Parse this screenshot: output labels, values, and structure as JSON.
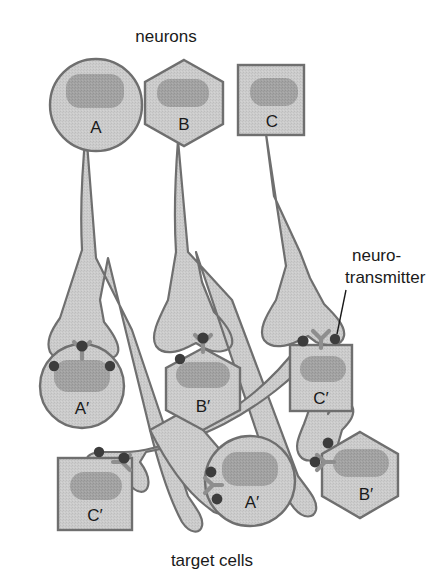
{
  "figure": {
    "title_top": "neurons",
    "caption_bottom": "target cells",
    "callout_line1": "neuro-",
    "callout_line2": "transmitter"
  },
  "colors": {
    "cytoplasm_fill": "#c9c9c9",
    "nucleus_fill": "#a0a0a0",
    "outline": "#6f6f6f",
    "neurite_fill": "#c4c4c4",
    "neurotransmitter_dot": "#3c3c3c",
    "receptor": "#9a9a9a",
    "text": "#1a1a1a",
    "background": "#ffffff"
  },
  "neurons": [
    {
      "id": "A",
      "label": "A",
      "shape": "circle",
      "cx": 96,
      "cy": 105
    },
    {
      "id": "B",
      "label": "B",
      "shape": "hexagon",
      "cx": 184,
      "cy": 102
    },
    {
      "id": "C",
      "label": "C",
      "shape": "square",
      "cx": 272,
      "cy": 100
    }
  ],
  "target_cells": [
    {
      "id": "A-prime-1",
      "label": "A′",
      "shape": "circle",
      "cx": 82,
      "cy": 386
    },
    {
      "id": "B-prime-1",
      "label": "B′",
      "shape": "hexagon",
      "cx": 203,
      "cy": 385
    },
    {
      "id": "C-prime-1",
      "label": "C′",
      "shape": "square",
      "cx": 320,
      "cy": 378
    },
    {
      "id": "C-prime-2",
      "label": "C′",
      "shape": "square",
      "cx": 97,
      "cy": 492
    },
    {
      "id": "A-prime-2",
      "label": "A′",
      "shape": "circle",
      "cx": 250,
      "cy": 481
    },
    {
      "id": "B-prime-2",
      "label": "B′",
      "shape": "hexagon",
      "cx": 360,
      "cy": 472
    }
  ],
  "synapses": [
    {
      "id": "synapse-A-to-Aprime1",
      "x": 82,
      "y": 352,
      "orientation": "down"
    },
    {
      "id": "synapse-B-to-Bprime1",
      "x": 203,
      "y": 345,
      "orientation": "down"
    },
    {
      "id": "synapse-C-to-Cprime1",
      "x": 320,
      "y": 339,
      "orientation": "down"
    },
    {
      "id": "synapse-to-Cprime2",
      "x": 122,
      "y": 461,
      "orientation": "down"
    },
    {
      "id": "synapse-to-Aprime2",
      "x": 213,
      "y": 483,
      "orientation": "right"
    },
    {
      "id": "synapse-to-Bprime2",
      "x": 325,
      "y": 462,
      "orientation": "right"
    }
  ],
  "neurotransmitter_dots": [
    {
      "x": 54,
      "y": 366
    },
    {
      "x": 82,
      "y": 345
    },
    {
      "x": 110,
      "y": 366
    },
    {
      "x": 180,
      "y": 359
    },
    {
      "x": 203,
      "y": 337
    },
    {
      "x": 303,
      "y": 340
    },
    {
      "x": 335,
      "y": 340
    },
    {
      "x": 99,
      "y": 453
    },
    {
      "x": 124,
      "y": 457
    },
    {
      "x": 211,
      "y": 473
    },
    {
      "x": 216,
      "y": 498
    },
    {
      "x": 327,
      "y": 443
    },
    {
      "x": 316,
      "y": 462
    }
  ],
  "callout": {
    "line_from_x": 345,
    "line_from_y": 289,
    "line_to_x": 336,
    "line_to_y": 338,
    "text_x": 355,
    "text_y1": 256,
    "text_y2": 278
  }
}
